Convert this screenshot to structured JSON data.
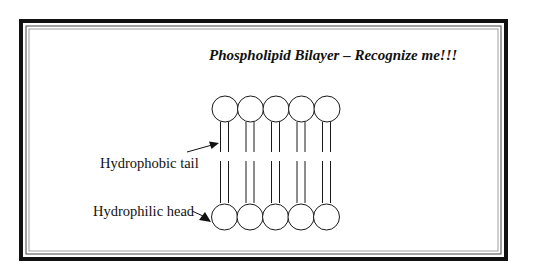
{
  "diagram": {
    "title": "Phospholipid Bilayer – Recognize me!!!",
    "labels": {
      "tail": "Hydrophobic tail",
      "head": "Hydrophilic head"
    },
    "structure": {
      "rows": 2,
      "molecules_per_row": 5,
      "parts": [
        "hydrophilic head (circle)",
        "hydrophobic tail (two lines)"
      ]
    },
    "colors": {
      "background": "#ffffff",
      "line": "#1a1a1a",
      "frame": "#111111"
    }
  }
}
